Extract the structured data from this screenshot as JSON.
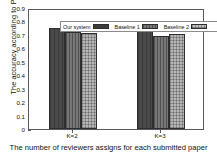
{
  "chart_data": {
    "type": "bar",
    "title": "",
    "xlabel": "The number of reviewers assigns for each submitted paper",
    "ylabel": "The accuracy according to Precision",
    "categories": [
      "K=2",
      "K=3"
    ],
    "series": [
      {
        "name": "Our system",
        "values": [
          0.75,
          0.735
        ],
        "color": "#4a4a4a",
        "pattern": "solid-dark"
      },
      {
        "name": "Baseline 1",
        "values": [
          0.72,
          0.69
        ],
        "color": "#777777",
        "pattern": "vertical-hatch"
      },
      {
        "name": "Baseline 2",
        "values": [
          0.715,
          0.705
        ],
        "color": "#b6b6b6",
        "pattern": "cross-hatch"
      }
    ],
    "ylim": [
      0,
      0.9
    ],
    "yticks": [
      "0",
      "0.1",
      "0.2",
      "0.3",
      "0.4",
      "0.5",
      "0.6",
      "0.7",
      "0.8",
      "0.9"
    ],
    "ytick_values": [
      0,
      0.1,
      0.2,
      0.3,
      0.4,
      0.5,
      0.6,
      0.7,
      0.8,
      0.9
    ],
    "grid": false,
    "legend_position": "top-left-inside",
    "frame": true
  }
}
